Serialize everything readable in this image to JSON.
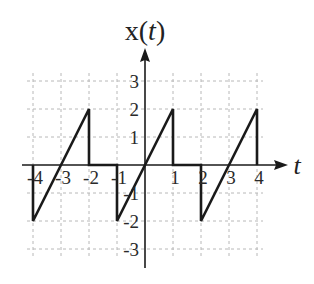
{
  "chart_data": {
    "type": "line",
    "title": "x(t)",
    "title_parts": {
      "prefix": "x(",
      "var": "t",
      "suffix": ")"
    },
    "xlabel": "t",
    "ylabel": "x(t)",
    "xlim": [
      -4,
      4
    ],
    "ylim": [
      -3,
      3
    ],
    "grid": true,
    "grid_style": "dashed",
    "x_ticks": [
      -4,
      -3,
      -2,
      -1,
      1,
      2,
      3,
      4
    ],
    "x_tick_labels": [
      "-4",
      "-3",
      "-2",
      "-1",
      "1",
      "2",
      "3",
      "4"
    ],
    "y_ticks": [
      3,
      2,
      1,
      -1,
      -2,
      -3
    ],
    "y_tick_labels": [
      "3",
      "2",
      "1",
      "-1",
      "-2",
      "-3"
    ],
    "series": [
      {
        "name": "x(t)",
        "description": "periodic sawtooth, period 3, slope 2, drops to 0 then to -2",
        "x": [
          -4,
          -4,
          -2,
          -2,
          -1,
          -1,
          1,
          1,
          2,
          2,
          4,
          4
        ],
        "y": [
          0,
          -2,
          2,
          0,
          0,
          -2,
          2,
          0,
          0,
          -2,
          2,
          0
        ]
      }
    ],
    "legend": null
  },
  "colors": {
    "signal": "#1a1a1a",
    "axis": "#1a1a1a",
    "grid": "#b8b8b8",
    "text": "#222222",
    "background": "#ffffff"
  }
}
